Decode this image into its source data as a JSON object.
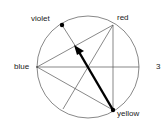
{
  "figure": {
    "number_label": "3",
    "labels": {
      "violet": "violet",
      "red": "red",
      "blue": "blue",
      "yellow": "yellow"
    }
  },
  "geometry": {
    "circle": {
      "cx": 88,
      "cy": 67,
      "r": 51
    },
    "points": {
      "violet": [
        62,
        25
      ],
      "red": [
        113,
        25
      ],
      "blue": [
        37,
        67
      ],
      "yellow": [
        113,
        110
      ],
      "bottom_left": [
        63,
        109
      ],
      "right": [
        139,
        67
      ]
    },
    "arrow": {
      "from": "yellow",
      "to": [
        75,
        46
      ]
    }
  },
  "colors": {
    "stroke": "#555555",
    "arrow": "#000000",
    "text": "#222222"
  }
}
